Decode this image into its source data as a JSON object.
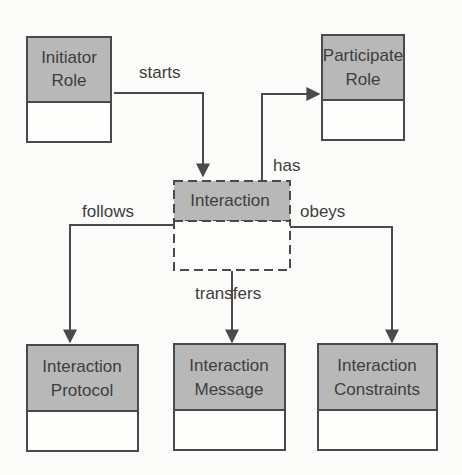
{
  "diagram": {
    "nodes": {
      "initiator": {
        "line1": "Initiator",
        "line2": "Role"
      },
      "participate": {
        "line1": "Participate",
        "line2": "Role"
      },
      "interaction": {
        "line1": "Interaction"
      },
      "protocol": {
        "line1": "Interaction",
        "line2": "Protocol"
      },
      "message": {
        "line1": "Interaction",
        "line2": "Message"
      },
      "constraints": {
        "line1": "Interaction",
        "line2": "Constraints"
      }
    },
    "edges": {
      "starts": "starts",
      "has": "has",
      "follows": "follows",
      "obeys": "obeys",
      "transfers": "transfers"
    }
  }
}
